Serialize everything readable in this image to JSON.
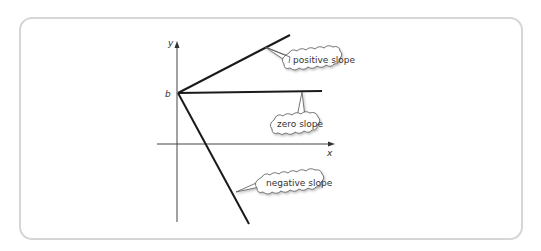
{
  "figure": {
    "axes": {
      "x_label": "x",
      "y_label": "y",
      "intercept_label": "b"
    },
    "lines": [
      {
        "name": "positive",
        "label": "positive slope"
      },
      {
        "name": "zero",
        "label": "zero slope"
      },
      {
        "name": "negative",
        "label": "negative slope"
      }
    ],
    "colors": {
      "line": "#1a1a1a",
      "axis": "#444444",
      "frame_border": "#d6d6d6",
      "bubble_fill": "#ffffff",
      "bubble_stroke": "#555555"
    }
  }
}
